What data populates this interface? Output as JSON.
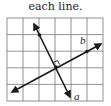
{
  "caption": "each line.",
  "diagram": {
    "grid": {
      "cols": 6,
      "rows": 5,
      "color": "#777777"
    },
    "lines": [
      {
        "name": "a",
        "label": "a"
      },
      {
        "name": "b",
        "label": "b"
      }
    ],
    "perpendicular_mark": true,
    "line_color": "#1a1a1a"
  }
}
